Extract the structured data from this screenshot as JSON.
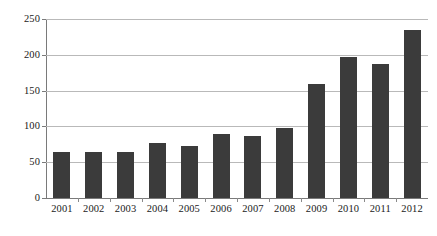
{
  "chart_data": {
    "type": "bar",
    "title": "",
    "subtitle": "",
    "xlabel": "",
    "ylabel": "",
    "categories": [
      "2001",
      "2002",
      "2003",
      "2004",
      "2005",
      "2006",
      "2007",
      "2008",
      "2009",
      "2010",
      "2011",
      "2012"
    ],
    "values": [
      64,
      64,
      64,
      77,
      73,
      90,
      86,
      98,
      159,
      197,
      187,
      234
    ],
    "series": [
      {
        "name": "",
        "values": [
          64,
          64,
          64,
          77,
          73,
          90,
          86,
          98,
          159,
          197,
          187,
          234
        ]
      }
    ],
    "ylim": [
      0,
      250
    ],
    "ytick_labels": [
      "0",
      "50",
      "100",
      "150",
      "200",
      "250"
    ],
    "ytick_values": [
      0,
      50,
      100,
      150,
      200,
      250
    ],
    "grid": "horizontal",
    "legend": "none",
    "bar_color": "#3b3b3b",
    "grid_color": "#b9b9b9",
    "axis_color": "#7a7a7a",
    "background_color": "#ffffff"
  }
}
